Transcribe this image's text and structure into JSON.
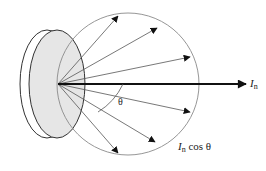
{
  "diagram": {
    "colors": {
      "disc_fill": "#e6e6e6",
      "disc_stroke": "#333333",
      "circle_stroke": "#8a8a8a",
      "ray_stroke": "#555555",
      "main_arrow": "#111111"
    },
    "labels": {
      "normal_intensity_symbol": "I",
      "normal_intensity_subscript": "n",
      "angle_symbol": "θ",
      "angled_intensity_symbol": "I",
      "angled_intensity_subscript": "n",
      "angled_intensity_suffix": " cos θ"
    },
    "geometry": {
      "origin": [
        58,
        84
      ],
      "circle": {
        "cx": 128,
        "cy": 84,
        "r": 71
      },
      "main_arrow_tip": [
        246,
        84
      ],
      "ray_tips": [
        [
          118,
          16
        ],
        [
          157,
          28
        ],
        [
          190,
          57
        ],
        [
          190,
          112
        ],
        [
          155,
          142
        ],
        [
          118,
          153
        ]
      ]
    }
  }
}
